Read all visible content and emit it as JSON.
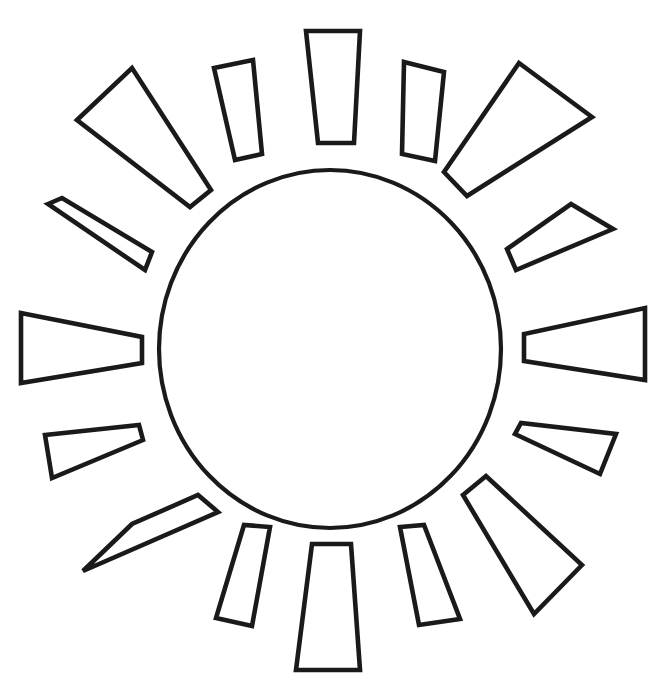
{
  "artwork": {
    "title": "Sun Coloring Page Outline",
    "subject": "sun",
    "style": "black line art on white background",
    "background_color": "#ffffff",
    "stroke_color": "#1a1a1a",
    "fill_color": "#ffffff",
    "stroke_width_px": 4.6,
    "canvas": {
      "width": 671,
      "height": 689
    }
  },
  "core": {
    "name": "sun-disc",
    "shape": "ellipse",
    "center_x": 330,
    "center_y": 349,
    "radius_x": 171,
    "radius_y": 179,
    "stroke_width_px": 4.2
  },
  "rays": {
    "count": 16,
    "arrangement": "radial, alternating large and small trapezoid rays around the central disc",
    "items": [
      {
        "index": 0,
        "label": "ray-12-oclock",
        "size": "medium",
        "angle_deg": -90,
        "points": "306,31 360,31 354,143 318,143"
      },
      {
        "index": 1,
        "label": "ray-1-oclock-small",
        "size": "small",
        "angle_deg": -67.5,
        "points": "404,62 444,72 435,161 402,154"
      },
      {
        "index": 2,
        "label": "ray-2-oclock-large",
        "size": "large",
        "angle_deg": -45,
        "points": "519,63 592,117 467,196 444,172"
      },
      {
        "index": 3,
        "label": "ray-3-oclock-small",
        "size": "small",
        "angle_deg": -22.5,
        "points": "571,204 613,229 516,270 507,249"
      },
      {
        "index": 4,
        "label": "ray-3-oclock",
        "size": "medium",
        "angle_deg": 0,
        "points": "645,308 645,380 524,361 524,334"
      },
      {
        "index": 5,
        "label": "ray-4-oclock-small",
        "size": "small",
        "angle_deg": 22.5,
        "points": "616,434 600,474 515,434 521,423"
      },
      {
        "index": 6,
        "label": "ray-5-oclock-large",
        "size": "large",
        "angle_deg": 45,
        "points": "582,565 534,614 463,495 486,476"
      },
      {
        "index": 7,
        "label": "ray-6-oclock-small",
        "size": "small",
        "angle_deg": 67.5,
        "points": "460,619 419,625 400,527 424,525"
      },
      {
        "index": 8,
        "label": "ray-6-oclock",
        "size": "medium",
        "angle_deg": 90,
        "points": "296,670 360,670 351,544 312,544"
      },
      {
        "index": 9,
        "label": "ray-7-oclock-small",
        "size": "small",
        "angle_deg": 112.5,
        "points": "216,618 252,626 270,527 244,525"
      },
      {
        "index": 10,
        "label": "ray-8-oclock-large",
        "size": "large",
        "angle_deg": 135,
        "points": "83,571 132,524 198,495 218,512"
      },
      {
        "index": 11,
        "label": "ray-9-oclock-small",
        "size": "small",
        "angle_deg": 157.5,
        "points": "52,478 45,435 139,425 143,440"
      },
      {
        "index": 12,
        "label": "ray-9-oclock",
        "size": "medium",
        "angle_deg": 180,
        "points": "21,313 21,383 142,363 142,337"
      },
      {
        "index": 13,
        "label": "ray-10-oclock-small",
        "size": "small",
        "angle_deg": 202.5,
        "points": "48,204 62,198 152,252 145,270"
      },
      {
        "index": 14,
        "label": "ray-11-oclock-large",
        "size": "large",
        "angle_deg": 225,
        "points": "77,120 132,68 211,190 190,207"
      },
      {
        "index": 15,
        "label": "ray-11-oclock-small",
        "size": "small",
        "angle_deg": 247.5,
        "points": "214,68 253,60 262,154 235,160"
      }
    ]
  }
}
